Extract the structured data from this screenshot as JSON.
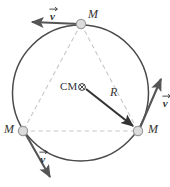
{
  "figure": {
    "type": "physics-diagram",
    "colors": {
      "circle_stroke": "#4a4a4a",
      "triangle_stroke": "#c9c4c4",
      "vector_arrow": "#555555",
      "radius_arrow": "#333333",
      "mass_fill": "#d8d8d8",
      "mass_stroke": "#9a9a9a",
      "text": "#333333",
      "background": "#ffffff"
    },
    "geometry": {
      "circle_center_x": 80.5,
      "circle_center_y": 93,
      "circle_radius": 68
    },
    "masses": [
      {
        "id": "mass-top",
        "label": "M",
        "x": 81,
        "y": 24,
        "label_x": 88,
        "label_y": 9
      },
      {
        "id": "mass-left",
        "label": "M",
        "x": 23,
        "y": 131,
        "label_x": 5,
        "label_y": 124
      },
      {
        "id": "mass-right",
        "label": "M",
        "x": 138,
        "y": 131,
        "label_x": 148,
        "label_y": 124
      }
    ],
    "velocity_vectors": [
      {
        "id": "velocity-top",
        "label": "v",
        "label_x": 50,
        "label_y": 5,
        "x1": 80,
        "y1": 24,
        "x2": 30,
        "y2": 22
      },
      {
        "id": "velocity-right",
        "label": "v",
        "label_x": 155,
        "label_y": 92,
        "x1": 139,
        "y1": 130,
        "x2": 162,
        "y2": 76
      },
      {
        "id": "velocity-left",
        "label": "v",
        "label_x": 25,
        "label_y": 148,
        "x1": 25,
        "y1": 133,
        "x2": 52,
        "y2": 180
      }
    ],
    "center_of_mass": {
      "label": "CM",
      "symbol": "⊗",
      "label_x": 61,
      "label_y": 82,
      "x": 82,
      "y": 87
    },
    "radius_vector": {
      "label": "R",
      "label_x": 110,
      "label_y": 87,
      "x1": 86,
      "y1": 89,
      "x2": 134,
      "y2": 127
    }
  }
}
